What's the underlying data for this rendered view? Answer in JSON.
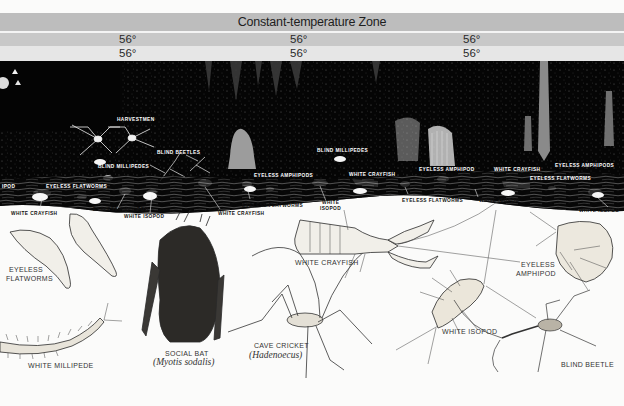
{
  "header": {
    "title": "Constant-temperature Zone",
    "row1_temps": [
      "56°",
      "56°",
      "56°"
    ],
    "row2_temps": [
      "56°",
      "56°",
      "56°"
    ]
  },
  "colors": {
    "title_band": "#bdbdbd",
    "row1_band": "#c8c8c8",
    "row2_band": "#e6e6e6",
    "cave": "#050505",
    "paper": "#fbfbfa",
    "ink": "#222222"
  },
  "cave_labels": {
    "harvestmen": "HARVESTMEN",
    "blind_beetles": "BLIND BEETLES",
    "blind_millipedes_1": "BLIND MILLIPEDES",
    "blind_millipedes_2": "BLIND MILLIPEDES",
    "eyeless_amphipods_1": "EYELESS AMPHIPODS",
    "eyeless_amphipod_2": "EYELESS AMPHIPOD",
    "eyeless_amphipod_3": "EYELESS AMPHIPOD",
    "eyeless_amphipods_4": "EYELESS AMPHIPODS",
    "isopod_cut": "IPOD",
    "eyeless_flatworms_1": "EYELESS FLATWORMS",
    "white_crayfish_1": "WHITE CRAYFISH",
    "white_crayfish_2": "WHITE CRAYFISH",
    "eyeless_flatworms_2": "EYELESS FLATWORMS"
  },
  "shore_labels": {
    "white_crayfish_a": "WHITE CRAYFISH",
    "eyeless_amphipod": "EYELESS AMPHIPOD",
    "white_isopod_a": "WHITE ISOPOD",
    "white_crayfish_b": "WHITE CRAYFISH",
    "eyeless_flatworms_a": "EYELESS FLATWORMS",
    "white_isopod_b_line1": "WHITE",
    "white_isopod_b_line2": "ISOPOD",
    "eyeless_flatworms_b": "EYELESS FLATWORMS",
    "white_isopod_c": "WHITE ISOPOD",
    "white_isopod_d": "WHITE ISOPOD"
  },
  "specimens": [
    {
      "id": "flatworms",
      "label_line1": "EYELESS",
      "label_line2": "FLATWORMS"
    },
    {
      "id": "millipede",
      "label": "WHITE MILLIPEDE"
    },
    {
      "id": "bat",
      "label": "SOCIAL BAT",
      "scientific": "(Myotis sodalis)"
    },
    {
      "id": "cricket",
      "label": "CAVE CRICKET",
      "scientific": "(Hadenoecus)"
    },
    {
      "id": "crayfish",
      "label": "WHITE CRAYFISH"
    },
    {
      "id": "isopod",
      "label": "WHITE ISOPOD"
    },
    {
      "id": "amphipod",
      "label_line1": "EYELESS",
      "label_line2": "AMPHIPOD"
    },
    {
      "id": "beetle",
      "label": "BLIND BEETLE"
    }
  ]
}
